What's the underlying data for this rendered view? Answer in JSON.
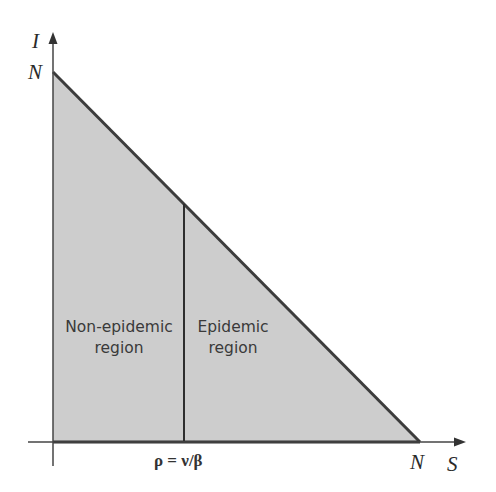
{
  "diagram": {
    "axes": {
      "x_label": "S",
      "y_label": "I",
      "x_intercept_label": "N",
      "y_intercept_label": "N"
    },
    "threshold_label": "ρ = ν/β",
    "regions": [
      {
        "line1": "Non-epidemic",
        "line2": "region"
      },
      {
        "line1": "Epidemic",
        "line2": "region"
      }
    ],
    "colors": {
      "fill": "#cdcdcd",
      "line": "#3c3c3c",
      "axis": "#444444"
    }
  }
}
